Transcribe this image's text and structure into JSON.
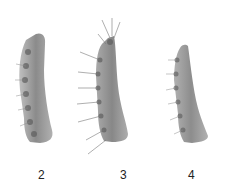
{
  "figure": {
    "panels": [
      {
        "id": "panel-2",
        "label": "2",
        "description": "specimen with short lateral setae"
      },
      {
        "id": "panel-3",
        "label": "3",
        "description": "specimen with long lateral setae"
      },
      {
        "id": "panel-4",
        "label": "4",
        "description": "specimen with short lateral setae"
      }
    ],
    "colors": {
      "background": "#ffffff",
      "specimen": "#8a8a8a",
      "specimen_dark": "#5e5e5e",
      "label": "#222222"
    }
  }
}
